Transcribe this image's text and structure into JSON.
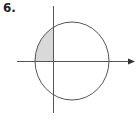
{
  "figure": {
    "number_label": "6.",
    "colors": {
      "stroke": "#555555",
      "shade": "#d9d9d9",
      "background": "#ffffff"
    },
    "shaded_region": "Quadrant II portion of circle interior"
  }
}
